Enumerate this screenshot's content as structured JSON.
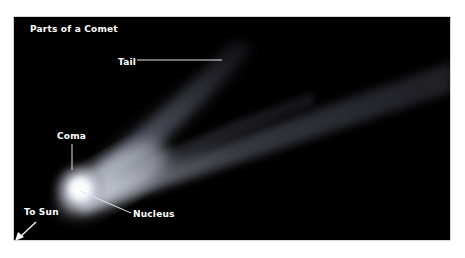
{
  "diagram": {
    "title": "Parts of a Comet",
    "labels": {
      "tail": "Tail",
      "coma": "Coma",
      "nucleus": "Nucleus",
      "to_sun": "To Sun"
    },
    "colors": {
      "background": "#000000",
      "label_text": "#ffffff",
      "leader_line": "#e6e6e6",
      "coma_glow": "#eef2fb",
      "tail_glow": "#8a8fa8"
    }
  }
}
